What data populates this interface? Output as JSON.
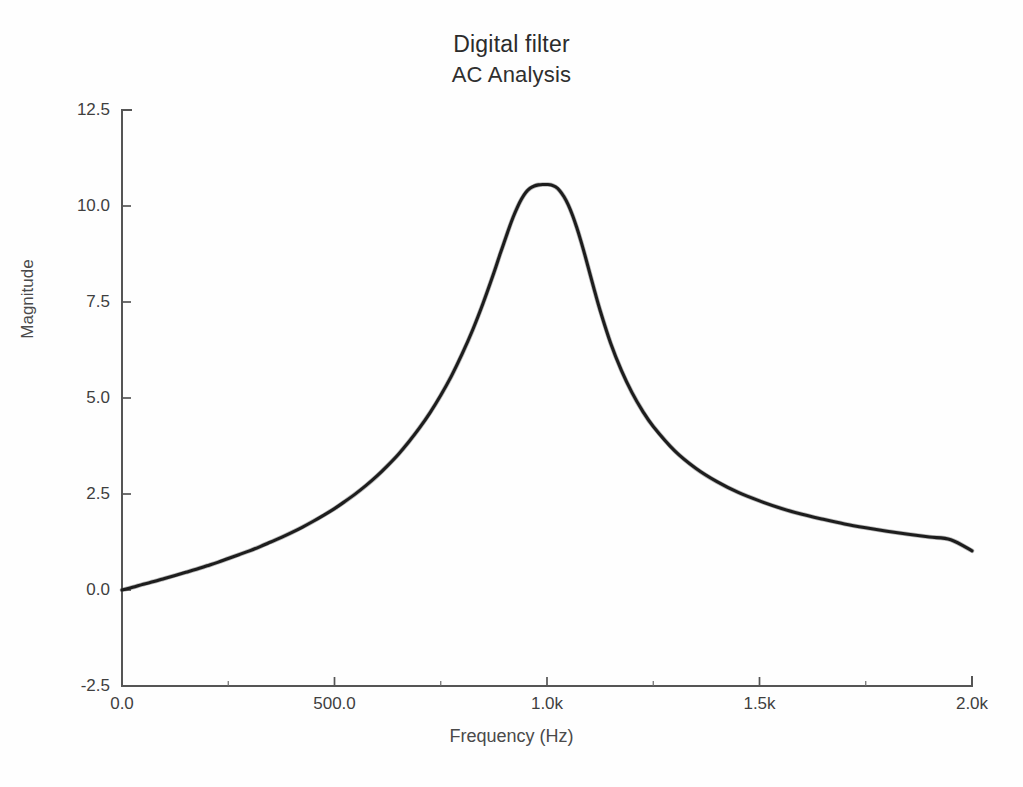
{
  "figure": {
    "title_main": "Digital filter",
    "title_sub": "AC Analysis",
    "background_color": "#ffffff",
    "curve_color": "#1d1d1d",
    "axis_color": "#555555"
  },
  "axes": {
    "x_title": "Frequency (Hz)",
    "y_title": "Magnitude",
    "x_tick_labels": [
      "0.0",
      "500.0",
      "1.0k",
      "1.5k",
      "2.0k"
    ],
    "y_tick_labels": [
      "12.5",
      "10.0",
      "7.5",
      "5.0",
      "2.5",
      "0.0",
      "-2.5"
    ]
  },
  "chart_data": {
    "type": "line",
    "xlabel": "Frequency (Hz)",
    "ylabel": "Magnitude",
    "xlim": [
      0,
      2000
    ],
    "ylim": [
      -2.5,
      12.5
    ],
    "grid": false,
    "legend": "none",
    "x_ticks": [
      0,
      500,
      1000,
      1500,
      2000
    ],
    "x_tick_labels": [
      "0.0",
      "500.0",
      "1.0k",
      "1.5k",
      "2.0k"
    ],
    "x_minor_ticks": [
      250,
      750,
      1250,
      1750
    ],
    "y_ticks": [
      -2.5,
      0.0,
      2.5,
      5.0,
      7.5,
      10.0,
      12.5
    ],
    "y_tick_labels": [
      "-2.5",
      "0.0",
      "2.5",
      "5.0",
      "7.5",
      "10.0",
      "12.5"
    ],
    "annotations": {
      "peak_frequency_hz": 1010,
      "peak_magnitude": 10.5,
      "value_at_dc": 0.0,
      "value_at_2k": 1.0
    },
    "series": [
      {
        "name": "Magnitude",
        "color": "#1d1d1d",
        "x": [
          0,
          25,
          50,
          75,
          100,
          125,
          150,
          175,
          200,
          225,
          250,
          275,
          300,
          325,
          350,
          375,
          400,
          425,
          450,
          475,
          500,
          525,
          550,
          575,
          600,
          625,
          650,
          675,
          700,
          725,
          750,
          775,
          800,
          825,
          850,
          875,
          890,
          900,
          910,
          920,
          930,
          940,
          950,
          960,
          970,
          980,
          990,
          1000,
          1010,
          1020,
          1030,
          1040,
          1050,
          1060,
          1070,
          1080,
          1090,
          1100,
          1110,
          1125,
          1150,
          1175,
          1200,
          1225,
          1250,
          1300,
          1350,
          1400,
          1450,
          1500,
          1550,
          1600,
          1650,
          1700,
          1750,
          1800,
          1850,
          1900,
          1950,
          2000
        ],
        "y": [
          0.0,
          0.07,
          0.15,
          0.22,
          0.3,
          0.38,
          0.46,
          0.54,
          0.63,
          0.72,
          0.82,
          0.92,
          1.02,
          1.13,
          1.25,
          1.37,
          1.5,
          1.64,
          1.79,
          1.95,
          2.12,
          2.31,
          2.51,
          2.73,
          2.97,
          3.24,
          3.53,
          3.86,
          4.22,
          4.62,
          5.07,
          5.57,
          6.14,
          6.77,
          7.48,
          8.26,
          8.76,
          9.08,
          9.4,
          9.7,
          9.96,
          10.18,
          10.35,
          10.46,
          10.52,
          10.55,
          10.56,
          10.56,
          10.55,
          10.5,
          10.4,
          10.24,
          10.03,
          9.76,
          9.44,
          9.08,
          8.69,
          8.28,
          7.87,
          7.28,
          6.42,
          5.72,
          5.14,
          4.66,
          4.26,
          3.63,
          3.17,
          2.82,
          2.54,
          2.32,
          2.13,
          1.97,
          1.84,
          1.72,
          1.62,
          1.53,
          1.45,
          1.38,
          1.31,
          1.02
        ]
      }
    ]
  }
}
